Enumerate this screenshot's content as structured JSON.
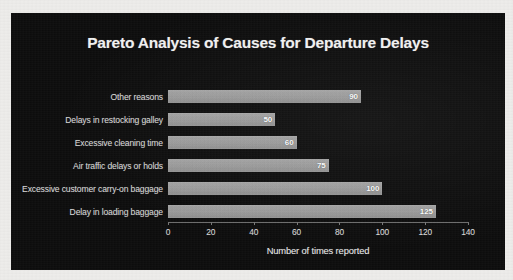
{
  "panel": {
    "background_color": "#0b0b0b",
    "page_background_color": "#efeeec",
    "bar_color": "#9a9a9a",
    "text_color": "#e6e6e6"
  },
  "chart_data": {
    "type": "bar",
    "orientation": "horizontal",
    "title": "Pareto Analysis of Causes for Departure Delays",
    "xlabel": "Number of times reported",
    "ylabel": "",
    "xlim": [
      0,
      140
    ],
    "xticks": [
      0,
      20,
      40,
      60,
      80,
      100,
      120,
      140
    ],
    "xtick_labels": [
      "0",
      "20",
      "40",
      "60",
      "80",
      "100",
      "120",
      "140"
    ],
    "grid": false,
    "legend": false,
    "categories": [
      "Other reasons",
      "Delays in restocking galley",
      "Excessive cleaning time",
      "Air traffic delays or holds",
      "Excessive customer carry-on baggage",
      "Delay in loading baggage"
    ],
    "values": [
      90,
      50,
      60,
      75,
      100,
      125
    ],
    "value_labels": [
      "90",
      "50",
      "60",
      "75",
      "100",
      "125"
    ],
    "bars": [
      {
        "category": "Other reasons",
        "value": 90,
        "label": "90"
      },
      {
        "category": "Delays in restocking galley",
        "value": 50,
        "label": "50"
      },
      {
        "category": "Excessive cleaning time",
        "value": 60,
        "label": "60"
      },
      {
        "category": "Air traffic delays or holds",
        "value": 75,
        "label": "75"
      },
      {
        "category": "Excessive customer carry-on baggage",
        "value": 100,
        "label": "100"
      },
      {
        "category": "Delay in loading baggage",
        "value": 125,
        "label": "125"
      }
    ]
  }
}
